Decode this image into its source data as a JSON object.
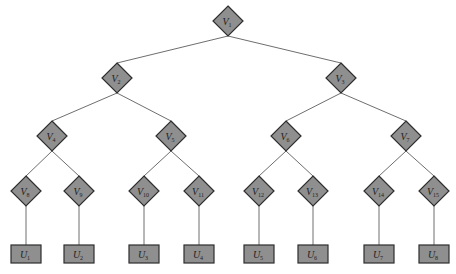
{
  "diagram": {
    "type": "binary-tree",
    "node_style": {
      "fill": "#8f8f8f",
      "stroke": "#2e2e2e",
      "edge": "#6e6e6e"
    },
    "v_nodes": [
      {
        "id": "V1",
        "base": "V",
        "sub": "1",
        "x": 228,
        "y": 21,
        "children": [
          "V2",
          "V3"
        ]
      },
      {
        "id": "V2",
        "base": "V",
        "sub": "2",
        "x": 117,
        "y": 78,
        "children": [
          "V4",
          "V5"
        ]
      },
      {
        "id": "V3",
        "base": "V",
        "sub": "3",
        "x": 341,
        "y": 78,
        "children": [
          "V6",
          "V7"
        ]
      },
      {
        "id": "V4",
        "base": "V",
        "sub": "4",
        "x": 52,
        "y": 136,
        "children": [
          "V8",
          "V9"
        ]
      },
      {
        "id": "V5",
        "base": "V",
        "sub": "5",
        "x": 171,
        "y": 136,
        "children": [
          "V10",
          "V11"
        ]
      },
      {
        "id": "V6",
        "base": "V",
        "sub": "6",
        "x": 286,
        "y": 136,
        "children": [
          "V12",
          "V13"
        ]
      },
      {
        "id": "V7",
        "base": "V",
        "sub": "7",
        "x": 406,
        "y": 136,
        "children": [
          "V14",
          "V15"
        ]
      },
      {
        "id": "V8",
        "base": "V",
        "sub": "8",
        "x": 26,
        "y": 191,
        "children": [
          "U1"
        ]
      },
      {
        "id": "V9",
        "base": "V",
        "sub": "9",
        "x": 79,
        "y": 191,
        "children": [
          "U2"
        ]
      },
      {
        "id": "V10",
        "base": "V",
        "sub": "10",
        "x": 144,
        "y": 191,
        "children": [
          "U3"
        ]
      },
      {
        "id": "V11",
        "base": "V",
        "sub": "11",
        "x": 199,
        "y": 191,
        "children": [
          "U4"
        ]
      },
      {
        "id": "V12",
        "base": "V",
        "sub": "12",
        "x": 259,
        "y": 191,
        "children": [
          "U5"
        ]
      },
      {
        "id": "V13",
        "base": "V",
        "sub": "13",
        "x": 313,
        "y": 191,
        "children": [
          "U6"
        ]
      },
      {
        "id": "V14",
        "base": "V",
        "sub": "14",
        "x": 379,
        "y": 191,
        "children": [
          "U7"
        ]
      },
      {
        "id": "V15",
        "base": "V",
        "sub": "15",
        "x": 434,
        "y": 191,
        "children": [
          "U8"
        ]
      }
    ],
    "u_nodes": [
      {
        "id": "U1",
        "base": "U",
        "sub": "1",
        "x": 26,
        "y": 254
      },
      {
        "id": "U2",
        "base": "U",
        "sub": "2",
        "x": 79,
        "y": 254
      },
      {
        "id": "U3",
        "base": "U",
        "sub": "3",
        "x": 144,
        "y": 254
      },
      {
        "id": "U4",
        "base": "U",
        "sub": "4",
        "x": 199,
        "y": 254
      },
      {
        "id": "U5",
        "base": "U",
        "sub": "5",
        "x": 259,
        "y": 254
      },
      {
        "id": "U6",
        "base": "U",
        "sub": "6",
        "x": 313,
        "y": 254
      },
      {
        "id": "U7",
        "base": "U",
        "sub": "7",
        "x": 379,
        "y": 254
      },
      {
        "id": "U8",
        "base": "U",
        "sub": "8",
        "x": 434,
        "y": 254
      }
    ]
  }
}
